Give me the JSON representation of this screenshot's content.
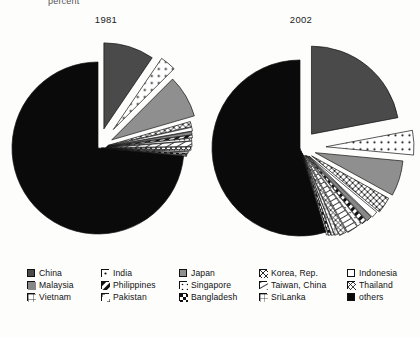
{
  "units_note": "percent",
  "legend": {
    "rows": [
      [
        {
          "label": "China",
          "pattern": "solid-darkgray"
        },
        {
          "label": "India",
          "pattern": "dots-sparse"
        },
        {
          "label": "Japan",
          "pattern": "solid-gray"
        },
        {
          "label": "Korea, Rep.",
          "pattern": "cross-x"
        },
        {
          "label": "Indonesia",
          "pattern": "empty-white"
        }
      ],
      [
        {
          "label": "Malaysia",
          "pattern": "vertical-lines"
        },
        {
          "label": "Philippines",
          "pattern": "diagonal-block"
        },
        {
          "label": "Singapore",
          "pattern": "dots-fine"
        },
        {
          "label": "Taiwan, China",
          "pattern": "diagonal-steep"
        },
        {
          "label": "Thailand",
          "pattern": "crosshatch"
        }
      ],
      [
        {
          "label": "Vietnam",
          "pattern": "grid-fine"
        },
        {
          "label": "Pakistan",
          "pattern": "corner-marks"
        },
        {
          "label": "Bangladesh",
          "pattern": "checker"
        },
        {
          "label": "SriLanka",
          "pattern": "grid-dense"
        },
        {
          "label": "others",
          "pattern": "solid-black"
        }
      ]
    ]
  },
  "chart_data": [
    {
      "type": "pie",
      "title": "1981",
      "unit": "percent",
      "exploded": true,
      "categories": [
        "China",
        "India",
        "Japan",
        "Korea, Rep.",
        "Indonesia",
        "Malaysia",
        "Philippines",
        "Singapore",
        "Taiwan, China",
        "Thailand",
        "Vietnam",
        "Pakistan",
        "Bangladesh",
        "SriLanka",
        "others"
      ],
      "values": [
        9.5,
        3.0,
        8.0,
        1.0,
        0.7,
        0.6,
        0.5,
        0.5,
        1.0,
        0.6,
        0.3,
        0.3,
        0.3,
        0.2,
        73.5
      ]
    },
    {
      "type": "pie",
      "title": "2002",
      "unit": "percent",
      "exploded": true,
      "categories": [
        "China",
        "India",
        "Japan",
        "Korea, Rep.",
        "Indonesia",
        "Malaysia",
        "Philippines",
        "Singapore",
        "Taiwan, China",
        "Thailand",
        "Vietnam",
        "Pakistan",
        "Bangladesh",
        "SriLanka",
        "others"
      ],
      "values": [
        22.0,
        4.5,
        6.5,
        3.0,
        1.2,
        1.0,
        0.9,
        0.8,
        2.0,
        1.4,
        0.7,
        0.5,
        0.5,
        0.3,
        54.7
      ]
    }
  ]
}
